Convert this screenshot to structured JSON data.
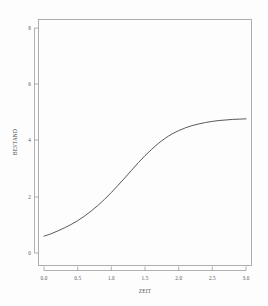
{
  "chart_data": {
    "type": "line",
    "title": "",
    "subtitle": "",
    "xlabel": "ZEIT",
    "ylabel": "BESTAND",
    "xlim": [
      0.0,
      3.0
    ],
    "ylim": [
      0,
      8
    ],
    "grid": false,
    "legend": null,
    "legend_position": "none",
    "style": "r-base-graphics",
    "xticks": [
      "0.0",
      "0.5",
      "1.0",
      "1.5",
      "2.0",
      "2.5",
      "3.0"
    ],
    "xtick_values": [
      0.0,
      0.5,
      1.0,
      1.5,
      2.0,
      2.5,
      3.0
    ],
    "yticks": [
      "0",
      "2",
      "4",
      "6",
      "8"
    ],
    "ytick_values": [
      0,
      2,
      4,
      6,
      8
    ],
    "series": [
      {
        "name": "BESTAND",
        "color": "#3b3b3b",
        "x": [
          0.0,
          0.1,
          0.2,
          0.3,
          0.4,
          0.5,
          0.6,
          0.7,
          0.8,
          0.9,
          1.0,
          1.1,
          1.2,
          1.3,
          1.4,
          1.5,
          1.6,
          1.7,
          1.8,
          1.9,
          2.0,
          2.1,
          2.2,
          2.3,
          2.4,
          2.5,
          2.6,
          2.7,
          2.8,
          2.9,
          3.0
        ],
        "values": [
          0.6,
          0.68,
          0.78,
          0.89,
          1.01,
          1.15,
          1.31,
          1.49,
          1.69,
          1.91,
          2.15,
          2.41,
          2.67,
          2.94,
          3.21,
          3.46,
          3.69,
          3.9,
          4.08,
          4.23,
          4.35,
          4.45,
          4.53,
          4.59,
          4.64,
          4.68,
          4.71,
          4.73,
          4.75,
          4.76,
          4.77
        ]
      }
    ],
    "annotations": []
  },
  "axes": {
    "x_title": "ZEIT",
    "y_title": "BESTAND"
  }
}
